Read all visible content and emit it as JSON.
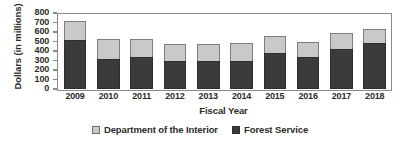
{
  "chart_data": {
    "type": "bar",
    "subtype": "stacked",
    "title": "",
    "xlabel": "Fiscal Year",
    "ylabel": "Dollars (in millions)",
    "categories": [
      "2009",
      "2010",
      "2011",
      "2012",
      "2013",
      "2014",
      "2015",
      "2016",
      "2017",
      "2018"
    ],
    "series": [
      {
        "name": "Forest Service",
        "color": "#3b3b3b",
        "values": [
          515,
          320,
          335,
          300,
          290,
          295,
          375,
          335,
          425,
          485
        ]
      },
      {
        "name": "Department of the Interior",
        "color": "#c9c9c9",
        "values": [
          205,
          210,
          190,
          175,
          185,
          185,
          185,
          165,
          160,
          145
        ]
      }
    ],
    "totals": [
      720,
      530,
      525,
      475,
      475,
      480,
      560,
      500,
      585,
      630
    ],
    "ylim": [
      0,
      800
    ],
    "yticks": [
      0,
      100,
      200,
      300,
      400,
      500,
      600,
      700,
      800
    ],
    "ytick_labels": [
      "0",
      "100",
      "200",
      "300",
      "400",
      "500",
      "600",
      "700",
      "800"
    ],
    "grid": false,
    "legend_position": "bottom"
  },
  "legend": {
    "items": [
      {
        "label": "Department of the Interior",
        "swatch": "light-gray-swatch"
      },
      {
        "label": "Forest Service",
        "swatch": "dark-gray-swatch"
      }
    ]
  }
}
